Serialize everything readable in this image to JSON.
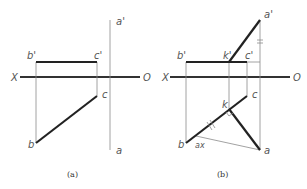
{
  "diagram": {
    "type": "descriptive-geometry-projection",
    "panels": [
      {
        "id": "a",
        "caption": "(a)",
        "axis_labels": {
          "left": "X",
          "right": "O"
        },
        "points": {
          "b_prime": "b'",
          "c_prime": "c'",
          "a_prime": "a'",
          "b": "b",
          "c": "c",
          "a": "a"
        }
      },
      {
        "id": "b",
        "caption": "(b)",
        "axis_labels": {
          "left": "X",
          "right": "O"
        },
        "points": {
          "b_prime": "b'",
          "k_prime": "k'",
          "c_prime": "c'",
          "a_prime": "a'",
          "b": "b",
          "k": "k",
          "c": "c",
          "a": "a",
          "ax": "ax"
        },
        "marks": {
          "equal_mark": "=",
          "parallel_mark": "//",
          "right_angle_at": "k"
        }
      }
    ]
  }
}
